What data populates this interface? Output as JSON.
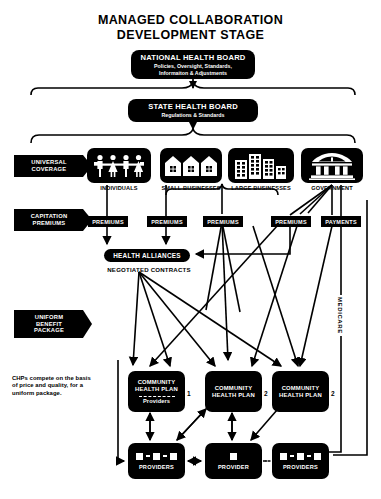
{
  "title": {
    "line1": "MANAGED COLLABORATION",
    "line2": "DEVELOPMENT STAGE"
  },
  "boards": {
    "national": {
      "name": "NATIONAL HEALTH BOARD",
      "subtitle_line1": "Policies, Oversight, Standards,",
      "subtitle_line2": "Informaiton & Adjustments"
    },
    "state": {
      "name": "STATE HEALTH BOARD",
      "subtitle": "Regulations & Standards"
    }
  },
  "flags": {
    "universal_coverage_line1": "UNIVERSAL",
    "universal_coverage_line2": "COVERAGE",
    "capitation_line1": "CAPITATION",
    "capitation_line2": "PREMIUMS",
    "uniform_line1": "UNIFORM",
    "uniform_line2": "BENEFIT",
    "uniform_line3": "PACKAGE"
  },
  "sectors": [
    {
      "id": "individuals",
      "label": "INDIVIDUALS",
      "icon": "family-people-icon"
    },
    {
      "id": "small-businesses",
      "label": "SMALL BUSINESSES",
      "icon": "houses-icon"
    },
    {
      "id": "large-businesses",
      "label": "LARGE BUSINESSES",
      "icon": "office-buildings-icon"
    },
    {
      "id": "government",
      "label": "GOVERNMENT",
      "icon": "capitol-building-icon"
    }
  ],
  "tags": {
    "premiums_1": "PREMIUMS",
    "premiums_2": "PREMIUMS",
    "premiums_3": "PREMIUMS",
    "premiums_4": "PREMIUMS",
    "payments": "PAYMENTS"
  },
  "alliances": {
    "label": "HEALTH ALLIANCES",
    "contracts_label": "NEGOTIATED CONTRACTS"
  },
  "note": {
    "chp_note": "CHPs compete on the basis of price and quality, for a uniform package."
  },
  "community_health_plans": [
    {
      "title_line1": "COMMUNITY",
      "title_line2": "HEALTH PLAN",
      "providers_label": "Providers",
      "number": "1",
      "has_providers_row": true
    },
    {
      "title_line1": "COMMUNITY",
      "title_line2": "HEALTH PLAN",
      "providers_label": "",
      "number": "2",
      "has_providers_row": false
    },
    {
      "title_line1": "COMMUNITY",
      "title_line2": "HEALTH PLAN",
      "providers_label": "",
      "number": "2",
      "has_providers_row": false
    }
  ],
  "providers": [
    {
      "label": "PROVIDERS",
      "count": 3
    },
    {
      "label": "PROVIDER",
      "count": 1
    },
    {
      "label": "PROVIDERS",
      "count": 3
    }
  ],
  "medicare_label": "MEDICARE",
  "colors": {
    "ink": "#000000",
    "paper": "#ffffff"
  }
}
